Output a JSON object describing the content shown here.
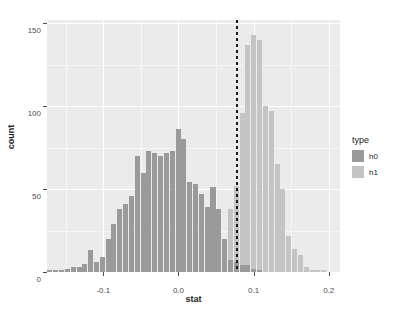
{
  "chart_data": {
    "type": "bar",
    "subtype": "overlaid-histogram",
    "title": "",
    "xlabel": "stat",
    "ylabel": "count",
    "xlim": [
      -0.175,
      0.215
    ],
    "ylim": [
      0,
      152
    ],
    "xticks": [
      -0.1,
      0.0,
      0.1,
      0.2
    ],
    "xtick_labels": [
      "-0.1",
      "0.0",
      "0.1",
      "0.2"
    ],
    "yticks": [
      0,
      50,
      100,
      150
    ],
    "ytick_labels": [
      "0",
      "50",
      "100",
      "150"
    ],
    "grid": true,
    "legend_position": "right",
    "legend_title": "type",
    "bin_width": 0.00775,
    "annotations": [
      {
        "name": "critical-value-line",
        "type": "vline",
        "x": 0.0775,
        "style": "dotted",
        "color": "#1a1a1a"
      }
    ],
    "series": [
      {
        "name": "h0",
        "color": "#9a9a9a",
        "x": [
          -0.1705,
          -0.1628,
          -0.155,
          -0.1473,
          -0.1395,
          -0.1318,
          -0.124,
          -0.1163,
          -0.1085,
          -0.1008,
          -0.093,
          -0.0853,
          -0.0775,
          -0.0698,
          -0.062,
          -0.0543,
          -0.0465,
          -0.0388,
          -0.031,
          -0.0233,
          -0.0155,
          -0.0078,
          0.0,
          0.0078,
          0.0155,
          0.0233,
          0.031,
          0.0388,
          0.0465,
          0.0543,
          0.062,
          0.0698,
          0.0775,
          0.0853,
          0.093,
          0.1008,
          0.1085
        ],
        "values": [
          1,
          1,
          1,
          2,
          3,
          3,
          5,
          13,
          6,
          9,
          20,
          29,
          38,
          41,
          46,
          70,
          60,
          73,
          72,
          70,
          72,
          73,
          86,
          80,
          54,
          53,
          47,
          39,
          51,
          38,
          20,
          7,
          6,
          4,
          4,
          2,
          1
        ]
      },
      {
        "name": "h1",
        "color": "#c4c4c4",
        "x": [
          -0.0233,
          0.0388,
          0.0465,
          0.0543,
          0.062,
          0.0698,
          0.0775,
          0.0853,
          0.093,
          0.1008,
          0.1085,
          0.1163,
          0.124,
          0.1318,
          0.1395,
          0.1473,
          0.155,
          0.1628,
          0.1705,
          0.1783,
          0.186,
          0.1938
        ],
        "values": [
          1,
          1,
          9,
          16,
          16,
          38,
          52,
          96,
          137,
          143,
          140,
          100,
          97,
          65,
          50,
          22,
          14,
          10,
          3,
          1,
          1,
          1
        ]
      }
    ]
  },
  "axes": {
    "x": {
      "title": "stat",
      "tick_labels": [
        "-0.1",
        "0.0",
        "0.1",
        "0.2"
      ]
    },
    "y": {
      "title": "count",
      "tick_labels": [
        "0",
        "50",
        "100",
        "150"
      ]
    }
  },
  "legend": {
    "title": "type",
    "items": [
      {
        "label": "h0",
        "color": "#9a9a9a"
      },
      {
        "label": "h1",
        "color": "#c4c4c4"
      }
    ]
  },
  "theme": {
    "panel_background": "#ebebeb",
    "grid_major": "#ffffff",
    "grid_minor": "#f6f6f6",
    "figure_background": "#ffffff",
    "text_color": "#4d4d4d"
  }
}
